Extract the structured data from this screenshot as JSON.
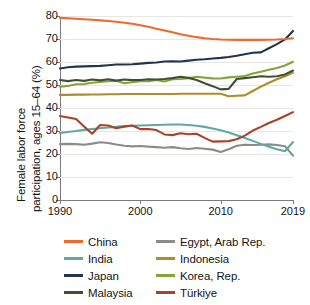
{
  "chart_data": {
    "type": "line",
    "title": "",
    "xlabel": "",
    "ylabel_line1": "Female labor force",
    "ylabel_line2": "participation, ages 15–64 (%)",
    "ylim": [
      0,
      80
    ],
    "xlim": [
      1990,
      2019
    ],
    "yticks": [
      0,
      10,
      20,
      30,
      40,
      50,
      60,
      70,
      80
    ],
    "ytick_labels": [
      "0",
      "10",
      "20",
      "30",
      "40",
      "50",
      "60",
      "70",
      "80"
    ],
    "xticks": [
      1990,
      2000,
      2010,
      2019
    ],
    "xtick_labels": [
      "1990",
      "2000",
      "2010",
      "2019"
    ],
    "grid": true,
    "legend_position": "below",
    "x": [
      1990,
      1991,
      1992,
      1993,
      1994,
      1995,
      1996,
      1997,
      1998,
      1999,
      2000,
      2001,
      2002,
      2003,
      2004,
      2005,
      2006,
      2007,
      2008,
      2009,
      2010,
      2011,
      2012,
      2013,
      2014,
      2015,
      2016,
      2017,
      2018,
      2019
    ],
    "series": [
      {
        "name": "China",
        "color": "#ED6A2C",
        "values": [
          79.2,
          79.0,
          78.8,
          78.6,
          78.4,
          78.1,
          77.8,
          77.5,
          77.1,
          76.6,
          76.0,
          75.3,
          74.5,
          73.7,
          72.9,
          72.1,
          71.4,
          70.8,
          70.3,
          70.0,
          69.8,
          69.7,
          69.6,
          69.6,
          69.6,
          69.6,
          69.7,
          69.8,
          70.0,
          70.3
        ]
      },
      {
        "name": "India",
        "color": "#5FA9A4",
        "values": [
          29.2,
          29.6,
          30.0,
          30.5,
          30.9,
          31.2,
          31.5,
          31.8,
          32.1,
          32.3,
          32.4,
          32.5,
          32.6,
          32.7,
          32.8,
          32.8,
          32.6,
          32.3,
          31.8,
          31.1,
          30.3,
          29.3,
          28.2,
          27.0,
          25.7,
          24.4,
          23.2,
          22.1,
          21.2,
          25.2
        ]
      },
      {
        "name": "Japan",
        "color": "#253352",
        "values": [
          57.2,
          57.7,
          58.0,
          58.1,
          58.2,
          58.3,
          58.6,
          58.9,
          58.9,
          59.0,
          59.3,
          59.6,
          59.8,
          60.2,
          60.3,
          60.2,
          60.6,
          61.0,
          61.2,
          61.5,
          61.8,
          62.2,
          62.7,
          63.4,
          64.0,
          64.2,
          66.0,
          67.8,
          69.8,
          73.5
        ]
      },
      {
        "name": "Malaysia",
        "color": "#3F4F33",
        "values": [
          52.2,
          51.7,
          52.2,
          51.8,
          52.4,
          52.0,
          52.5,
          51.9,
          52.4,
          52.1,
          52.2,
          52.5,
          52.4,
          52.6,
          53.0,
          53.6,
          53.1,
          52.2,
          50.8,
          49.5,
          48.1,
          48.3,
          52.6,
          53.0,
          53.4,
          53.8,
          53.6,
          53.8,
          54.6,
          56.3
        ]
      },
      {
        "name": "Egypt, Arab Rep.",
        "color": "#8B8B88",
        "values": [
          24.3,
          24.4,
          24.3,
          24.0,
          24.5,
          25.1,
          24.8,
          24.1,
          23.6,
          23.3,
          23.5,
          23.2,
          23.0,
          22.7,
          23.0,
          22.5,
          22.2,
          22.6,
          22.3,
          21.9,
          20.9,
          22.1,
          23.6,
          24.0,
          23.9,
          24.0,
          24.2,
          23.9,
          23.4,
          19.3
        ]
      },
      {
        "name": "Indonesia",
        "color": "#B08B2A",
        "values": [
          45.7,
          45.7,
          45.8,
          45.8,
          45.9,
          45.9,
          46.0,
          46.0,
          46.1,
          46.1,
          46.1,
          46.1,
          46.1,
          46.1,
          46.1,
          46.2,
          46.2,
          46.2,
          46.2,
          46.2,
          46.2,
          45.1,
          45.3,
          45.5,
          47.4,
          49.3,
          51.0,
          52.5,
          53.8,
          55.4
        ]
      },
      {
        "name": "Korea, Rep.",
        "color": "#86A338",
        "values": [
          49.3,
          49.6,
          50.3,
          50.4,
          51.0,
          51.3,
          51.6,
          51.8,
          50.8,
          51.2,
          51.6,
          51.6,
          52.2,
          51.5,
          52.5,
          52.6,
          53.0,
          53.6,
          53.2,
          52.9,
          52.8,
          53.3,
          53.6,
          53.9,
          55.0,
          55.8,
          56.6,
          57.4,
          58.5,
          60.1
        ]
      },
      {
        "name": "Türkiye",
        "color": "#A6432A",
        "values": [
          36.5,
          35.9,
          35.2,
          32.0,
          28.8,
          32.6,
          32.4,
          31.2,
          31.9,
          32.4,
          30.8,
          30.9,
          30.4,
          28.5,
          28.2,
          29.0,
          28.6,
          28.8,
          27.0,
          25.4,
          25.5,
          25.6,
          26.4,
          28.0,
          30.2,
          31.8,
          33.5,
          34.9,
          36.5,
          38.2
        ]
      }
    ]
  },
  "legend": {
    "items": [
      {
        "label": "China",
        "color": "#ED6A2C"
      },
      {
        "label": "Egypt, Arab Rep.",
        "color": "#8B8B88"
      },
      {
        "label": "India",
        "color": "#5FA9A4"
      },
      {
        "label": "Indonesia",
        "color": "#B08B2A"
      },
      {
        "label": "Japan",
        "color": "#253352"
      },
      {
        "label": "Korea, Rep.",
        "color": "#86A338"
      },
      {
        "label": "Malaysia",
        "color": "#3F4F33"
      },
      {
        "label": "Türkiye",
        "color": "#A6432A"
      }
    ]
  }
}
